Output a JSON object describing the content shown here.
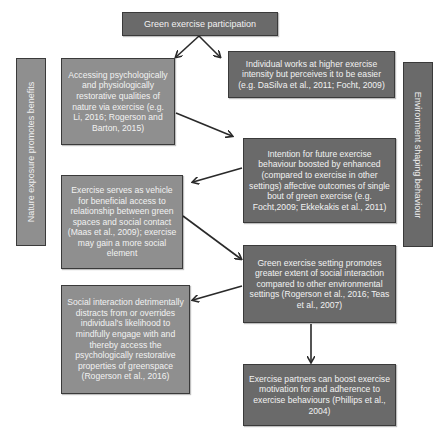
{
  "diagram": {
    "colors": {
      "dark_box": "#6a6a6a",
      "light_box": "#8f8f8f",
      "text": "#f2f2f2",
      "border": "#3a3a3a",
      "arrow": "#2a2a2a"
    },
    "top": {
      "label": "Green exercise participation"
    },
    "side_labels": {
      "left": "Nature exposure promotes benefits",
      "right": "Environment shaping behaviour"
    },
    "boxes": {
      "accessing": "Accessing psychologically and physiologically restorative qualities of nature via exercise (e.g. Li, 2016; Rogerson and Barton, 2015)",
      "individual": "Individual works at higher exercise intensity but perceives it to be easier (e.g. DaSilva et al., 2011; Focht, 2009)",
      "intention": "Intention for future exercise behaviour boosted by enhanced (compared to exercise in other settings) affective outcomes of single bout of green exercise (e.g. Focht,2009; Ekkekakis et al., 2011)",
      "vehicle": "Exercise serves as vehicle for beneficial access to relationship between green spaces and social contact (Maas et al., 2009); exercise may gain a more social element",
      "setting": "Green exercise setting promotes greater extent of social interaction compared to other environmental settings (Rogerson et al., 2016; Teas et al., 2007)",
      "social": "Social interaction detrimentally distracts from or overrides individual's likelihood to mindfully engage with and thereby access the psychologically restorative properties of greenspace (Rogerson et al., 2016)",
      "partners": "Exercise partners can boost exercise motivation for and adherence to exercise behaviours (Phillips et al., 2004)"
    },
    "edges": [
      {
        "from": "Green exercise participation",
        "to": "accessing"
      },
      {
        "from": "Green exercise participation",
        "to": "individual"
      },
      {
        "from": "accessing",
        "to": "intention"
      },
      {
        "from": "intention",
        "to": "vehicle"
      },
      {
        "from": "vehicle",
        "to": "setting"
      },
      {
        "from": "setting",
        "to": "social"
      },
      {
        "from": "setting",
        "to": "partners"
      }
    ]
  }
}
